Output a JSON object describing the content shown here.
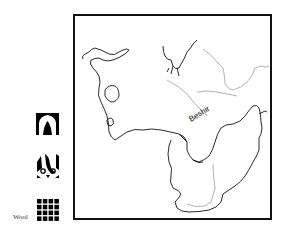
{
  "map": {
    "river_label": "Beshir",
    "colors": {
      "frame": "#111111",
      "border_line": "#111111",
      "river_line": "#a8a8a8",
      "background": "#ffffff"
    }
  },
  "legend": {
    "items": [
      {
        "icon": "arch-motif-icon",
        "label": ""
      },
      {
        "icon": "bird-motif-icon",
        "label": ""
      },
      {
        "icon": "wool-grid-icon",
        "label": "Wool"
      }
    ]
  }
}
